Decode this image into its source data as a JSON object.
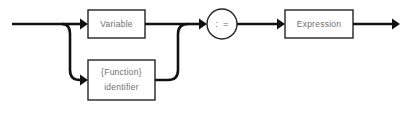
{
  "diagram": {
    "type": "railroad-syntax-diagram",
    "background_color": "#ffffff",
    "line_color": "#111111",
    "box_stroke_color": "#232323",
    "label_color": "#6f6f6f",
    "entry": {
      "name": "entry-rail",
      "arrow": "right"
    },
    "exit": {
      "name": "exit-rail",
      "arrow": "right"
    },
    "nodes": [
      {
        "id": "variable",
        "shape": "rect",
        "label": "Variable",
        "lines": [
          "Variable"
        ],
        "branch": "upper"
      },
      {
        "id": "function-identifier",
        "shape": "rect",
        "label": "{Function} identifier",
        "lines": [
          "{Function}",
          "identifier"
        ],
        "branch": "lower"
      },
      {
        "id": "assign-operator",
        "shape": "circle",
        "label": ": =",
        "lines": [
          ": ="
        ],
        "branch": "main"
      },
      {
        "id": "expression",
        "shape": "rect",
        "label": "Expression",
        "lines": [
          "Expression"
        ],
        "branch": "main"
      }
    ]
  }
}
